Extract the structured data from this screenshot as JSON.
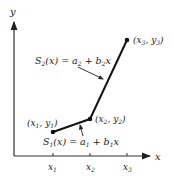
{
  "axes": {
    "x_label": "x",
    "y_label": "y",
    "ticks": [
      {
        "base": "x",
        "sub": "1",
        "px": 53
      },
      {
        "base": "x",
        "sub": "2",
        "px": 90
      },
      {
        "base": "x",
        "sub": "3",
        "px": 127
      }
    ]
  },
  "points": [
    {
      "label_open": "(x",
      "sub1": "1",
      "mid": ", y",
      "sub2": "1",
      "close": ")",
      "px": [
        53,
        132
      ]
    },
    {
      "label_open": "(x",
      "sub1": "2",
      "mid": ", y",
      "sub2": "2",
      "close": ")",
      "px": [
        90,
        119
      ]
    },
    {
      "label_open": "(x",
      "sub1": "3",
      "mid": ", y",
      "sub2": "3",
      "close": ")",
      "px": [
        127,
        40
      ]
    }
  ],
  "segments": [
    {
      "name": "S1",
      "formula": {
        "S": "S",
        "Ssub": "1",
        "arg": "(x) = a",
        "asub": "1",
        "plus": " + b",
        "bsub": "1",
        "tail": "x"
      }
    },
    {
      "name": "S2",
      "formula": {
        "S": "S",
        "Ssub": "2",
        "arg": "(x) = a",
        "asub": "2",
        "plus": " + b",
        "bsub": "2",
        "tail": "x"
      }
    }
  ],
  "colors": {
    "line": "#111111",
    "text": "#222222",
    "axis": "#333333"
  }
}
